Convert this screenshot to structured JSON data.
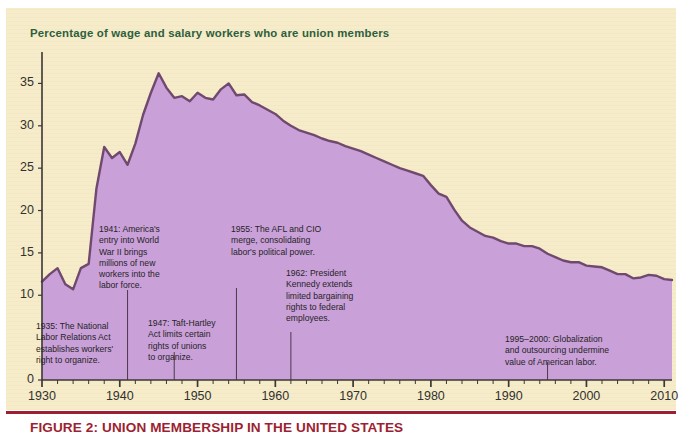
{
  "figure": {
    "title": "Percentage of wage and salary workers who are union members",
    "caption": "FIGURE 2: UNION MEMBERSHIP IN THE UNITED STATES",
    "colors": {
      "paper": "#f6ecc9",
      "title_text": "#2d5e3e",
      "caption_text": "#9d1f31",
      "area_fill": "#c9a0d8",
      "area_stroke": "#6f4a6e",
      "axis": "#3a3836",
      "annotation_text": "#262427",
      "leader_line": "#4a3a4a"
    }
  },
  "chart_data": {
    "type": "area",
    "title": "Percentage of wage and salary workers who are union members",
    "xlabel": "",
    "ylabel": "",
    "xlim": [
      1930,
      2011
    ],
    "ylim": [
      0,
      38
    ],
    "grid": false,
    "legend": null,
    "y_ticks": [
      0,
      10,
      15,
      20,
      25,
      30,
      35
    ],
    "y_tick_labels": [
      "0",
      "10",
      "15",
      "20",
      "25",
      "30",
      "35"
    ],
    "x_ticks": [
      1930,
      1940,
      1950,
      1960,
      1970,
      1980,
      1990,
      2000,
      2010
    ],
    "x_tick_labels": [
      "1930",
      "1940",
      "1950",
      "1960",
      "1970",
      "1980",
      "1990",
      "2000",
      "2010"
    ],
    "x_minor_tick_step": 2,
    "series": [
      {
        "name": "Union membership rate",
        "units": "percent",
        "x": [
          1930,
          1931,
          1932,
          1933,
          1934,
          1935,
          1936,
          1937,
          1938,
          1939,
          1940,
          1941,
          1942,
          1943,
          1944,
          1945,
          1946,
          1947,
          1948,
          1949,
          1950,
          1951,
          1952,
          1953,
          1954,
          1955,
          1956,
          1957,
          1958,
          1959,
          1960,
          1961,
          1962,
          1963,
          1964,
          1965,
          1966,
          1967,
          1968,
          1969,
          1970,
          1971,
          1972,
          1973,
          1974,
          1975,
          1976,
          1977,
          1978,
          1979,
          1980,
          1981,
          1982,
          1983,
          1984,
          1985,
          1986,
          1987,
          1988,
          1989,
          1990,
          1991,
          1992,
          1993,
          1994,
          1995,
          1996,
          1997,
          1998,
          1999,
          2000,
          2001,
          2002,
          2003,
          2004,
          2005,
          2006,
          2007,
          2008,
          2009,
          2010,
          2011
        ],
        "values": [
          11.6,
          12.5,
          13.2,
          11.3,
          10.7,
          13.2,
          13.7,
          22.6,
          27.5,
          26.2,
          26.9,
          25.4,
          27.9,
          31.3,
          33.9,
          36.2,
          34.5,
          33.3,
          33.5,
          32.9,
          33.9,
          33.3,
          33.1,
          34.3,
          35.0,
          33.6,
          33.7,
          32.8,
          32.4,
          31.9,
          31.4,
          30.6,
          30.0,
          29.5,
          29.2,
          28.9,
          28.5,
          28.2,
          28.0,
          27.6,
          27.3,
          27.0,
          26.6,
          26.2,
          25.8,
          25.4,
          25.0,
          24.7,
          24.4,
          24.1,
          23.0,
          22.0,
          21.6,
          20.1,
          18.8,
          18.0,
          17.5,
          17.0,
          16.8,
          16.4,
          16.1,
          16.1,
          15.8,
          15.8,
          15.5,
          14.9,
          14.5,
          14.1,
          13.9,
          13.9,
          13.5,
          13.4,
          13.3,
          12.9,
          12.5,
          12.5,
          12.0,
          12.1,
          12.4,
          12.3,
          11.9,
          11.8
        ]
      }
    ],
    "annotations": [
      {
        "id": "a1935",
        "year": 1935,
        "lines": [
          "1935: The National",
          "Labor Relations Act",
          "establishes workers'",
          "right to organize."
        ],
        "text": "1935: The National Labor Relations Act establishes workers' right to organize."
      },
      {
        "id": "a1941",
        "year": 1941,
        "lines": [
          "1941: America's",
          "entry into World",
          "War II brings",
          "millions of new",
          "workers into the",
          "labor force."
        ],
        "text": "1941: America's entry into World War II brings millions of new workers into the labor force."
      },
      {
        "id": "a1947",
        "year": 1947,
        "lines": [
          "1947: Taft-Hartley",
          "Act limits certain",
          "rights of unions",
          "to organize."
        ],
        "text": "1947: Taft-Hartley Act limits certain rights of unions to organize."
      },
      {
        "id": "a1955",
        "year": 1955,
        "lines": [
          "1955: The AFL and CIO",
          "merge, consolidating",
          "labor's political power."
        ],
        "text": "1955: The AFL and CIO merge, consolidating labor's political power."
      },
      {
        "id": "a1962",
        "year": 1962,
        "lines": [
          "1962: President",
          "Kennedy extends",
          "limited bargaining",
          "rights to federal",
          "employees."
        ],
        "text": "1962: President Kennedy extends limited bargaining rights to federal employees."
      },
      {
        "id": "a1995",
        "year": 1995,
        "lines": [
          "1995–2000: Globalization",
          "and outsourcing undermine",
          "value of American labor."
        ],
        "text": "1995–2000: Globalization and outsourcing undermine value of American labor."
      }
    ]
  }
}
